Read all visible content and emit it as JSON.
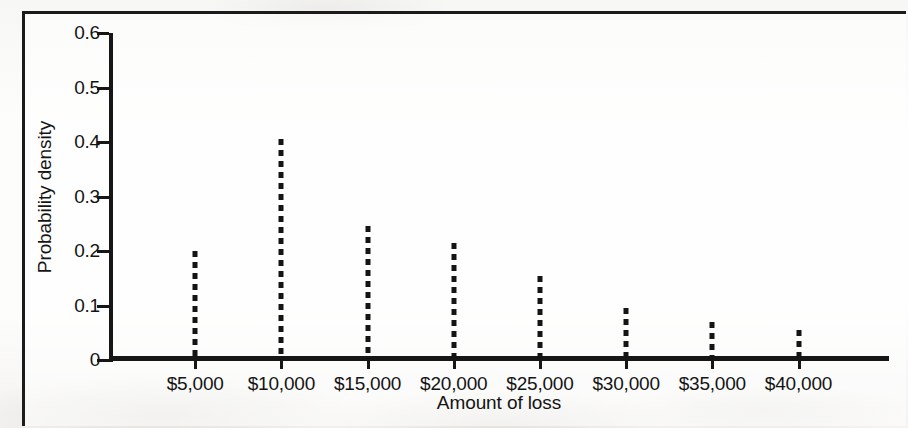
{
  "figure": {
    "frame_color": "#1b1b1b",
    "axis_color": "#161616",
    "page_background": "#fbfbfa"
  },
  "chart_data": {
    "type": "bar",
    "title": "",
    "subtitle": "",
    "xlabel": "Amount of loss",
    "ylabel": "Probability density",
    "categories": [
      "$5,000",
      "$10,000",
      "$15,000",
      "$20,000",
      "$25,000",
      "$30,000",
      "$35,000",
      "$40,000"
    ],
    "x_values": [
      5000,
      10000,
      15000,
      20000,
      25000,
      30000,
      35000,
      40000
    ],
    "values": [
      0.2,
      0.405,
      0.245,
      0.215,
      0.155,
      0.095,
      0.07,
      0.055
    ],
    "series": [
      {
        "name": "Probability density",
        "values": [
          0.2,
          0.405,
          0.245,
          0.215,
          0.155,
          0.095,
          0.07,
          0.055
        ]
      }
    ],
    "ylim": [
      0,
      0.6
    ],
    "y_ticks": [
      0,
      0.1,
      0.2,
      0.3,
      0.4,
      0.5,
      0.6
    ],
    "y_tick_labels": [
      "0",
      "0.1",
      "0.2",
      "0.3",
      "0.4",
      "0.5",
      "0.6"
    ],
    "x_tick_labels": [
      "$5,000",
      "$10,000",
      "$15,000",
      "$20,000",
      "$25,000",
      "$30,000",
      "$35,000",
      "$40,000"
    ],
    "grid": false,
    "legend": false,
    "legend_position": "none",
    "marker_style": "dashed-vertical-line",
    "annotations": []
  }
}
